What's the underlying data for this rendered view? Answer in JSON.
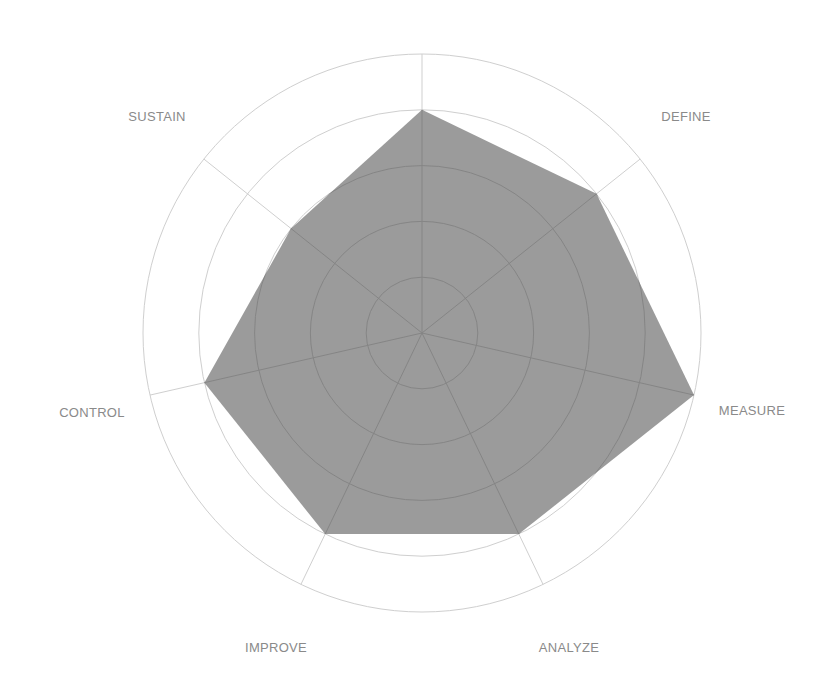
{
  "chart_data": {
    "type": "radar",
    "title": "",
    "axes": [
      "",
      "DEFINE",
      "MEASURE",
      "ANALYZE",
      "IMPROVE",
      "CONTROL",
      "SUSTAIN"
    ],
    "series": [
      {
        "name": "Score",
        "values": [
          4,
          4,
          5,
          4,
          4,
          4,
          3
        ]
      }
    ],
    "rlim": [
      0,
      5
    ],
    "rings": [
      1,
      2,
      3,
      4,
      5
    ],
    "grid": true,
    "legend": "none"
  },
  "style": {
    "fill_color": "#9b9b9b",
    "grid_color_outer": "#cfcfcf",
    "grid_color_inner": "#858585",
    "label_color": "#8a8a8a"
  },
  "geometry": {
    "cx": 422,
    "cy": 333,
    "radius": 279,
    "label_positions": [
      null,
      [
        686,
        121
      ],
      [
        752,
        415
      ],
      [
        569,
        652
      ],
      [
        276,
        652
      ],
      [
        92,
        417
      ],
      [
        157,
        121
      ]
    ]
  }
}
